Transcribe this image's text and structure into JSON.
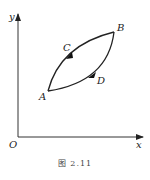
{
  "figure": {
    "caption": "图   2.11",
    "axes": {
      "x_label": "x",
      "y_label": "y",
      "origin_label": "O"
    },
    "points": {
      "A": "A",
      "B": "B",
      "C": "C",
      "D": "D"
    },
    "paths": [
      {
        "name": "ACB",
        "from": "A",
        "via": "C",
        "to": "B",
        "direction": "A→B"
      },
      {
        "name": "ADB",
        "from": "A",
        "via": "D",
        "to": "B",
        "direction": "A→B"
      }
    ],
    "colors": {
      "line": "#222222",
      "background": "#ffffff"
    }
  }
}
